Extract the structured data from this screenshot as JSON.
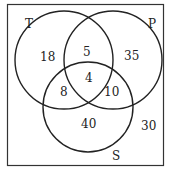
{
  "diagram": {
    "type": "venn",
    "sets": [
      {
        "id": "T",
        "label": "T",
        "cx": 66,
        "cy": 61,
        "r": 50
      },
      {
        "id": "P",
        "label": "P",
        "cx": 128,
        "cy": 61,
        "r": 50
      },
      {
        "id": "S",
        "label": "S",
        "cx": 88,
        "cy": 107,
        "r": 45
      }
    ],
    "regions": {
      "T_only": "18",
      "P_only": "35",
      "S_only": "40",
      "T_P_only": "5",
      "T_S_only": "8",
      "P_S_only": "10",
      "T_P_S": "4",
      "outside": "30"
    },
    "colors": {
      "stroke": "#222222",
      "background": "#ffffff"
    }
  }
}
